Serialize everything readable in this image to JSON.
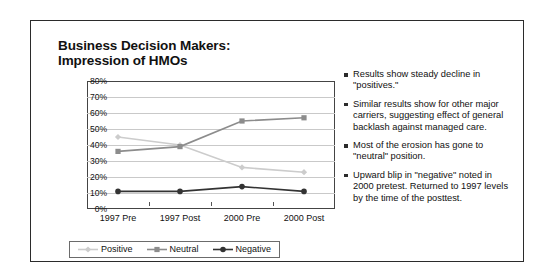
{
  "slide": {
    "title_line1": "Business Decision Makers:",
    "title_line2": "Impression of HMOs"
  },
  "chart_data": {
    "type": "line",
    "title": "Business Decision Makers: Impression of HMOs",
    "xlabel": "",
    "ylabel": "",
    "ylim": [
      0,
      80
    ],
    "ytick_labels": [
      "0%",
      "10%",
      "20%",
      "30%",
      "40%",
      "50%",
      "60%",
      "70%",
      "80%"
    ],
    "ytick_values": [
      0,
      10,
      20,
      30,
      40,
      50,
      60,
      70,
      80
    ],
    "grid": true,
    "legend_position": "bottom",
    "categories": [
      "1997 Pre",
      "1997 Post",
      "2000 Pre",
      "2000 Post"
    ],
    "series": [
      {
        "name": "Positive",
        "values": [
          45,
          40,
          26,
          23
        ],
        "color": "#cccccc",
        "marker": "diamond"
      },
      {
        "name": "Neutral",
        "values": [
          36,
          39,
          55,
          57
        ],
        "color": "#8c8c8c",
        "marker": "square"
      },
      {
        "name": "Negative",
        "values": [
          11,
          11,
          14,
          11
        ],
        "color": "#333333",
        "marker": "circle"
      }
    ]
  },
  "bullets": [
    {
      "text": "Results show steady decline in \"positives.\""
    },
    {
      "text": "Similar results show for other major carriers, suggesting effect of general backlash against managed care."
    },
    {
      "text": "Most of the erosion has gone to \"neutral\" position."
    },
    {
      "text": "Upward blip in \"negative\" noted in 2000 pretest. Returned to 1997 levels by the time of the posttest."
    }
  ]
}
